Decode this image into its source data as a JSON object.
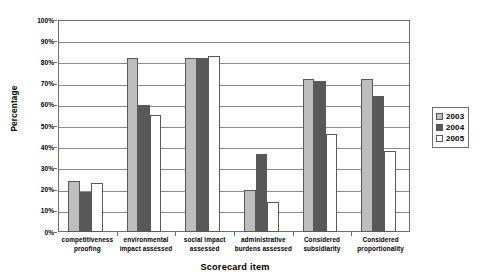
{
  "chart_data": {
    "type": "bar",
    "title": "",
    "xlabel": "Scorecard item",
    "ylabel": "Percentage",
    "ylim": [
      0,
      100
    ],
    "y_tick_labels": [
      "100%",
      "90%",
      "80%",
      "70%",
      "60%",
      "50%",
      "40%",
      "30%",
      "20%",
      "10%",
      "0%"
    ],
    "y_tick_values": [
      100,
      90,
      80,
      70,
      60,
      50,
      40,
      30,
      20,
      10,
      0
    ],
    "grid": true,
    "legend_position": "right",
    "categories": [
      "competitiveness proofing",
      "environmental impact assessed",
      "social impact assessed",
      "administrative burdens assessed",
      "Considered subsidiarity",
      "Considered proportionality"
    ],
    "category_lines": [
      [
        "competitiveness",
        "proofing"
      ],
      [
        "environmental",
        "impact assessed"
      ],
      [
        "social impact",
        "assessed"
      ],
      [
        "administrative",
        "burdens assessed"
      ],
      [
        "Considered",
        "subsidiarity"
      ],
      [
        "Considered",
        "proportionality"
      ]
    ],
    "series": [
      {
        "name": "2003",
        "color": "#bdbdbd",
        "values": [
          24,
          82,
          82,
          20,
          72,
          72
        ]
      },
      {
        "name": "2004",
        "color": "#585858",
        "values": [
          19,
          60,
          82,
          37,
          71,
          64
        ]
      },
      {
        "name": "2005",
        "color": "#ffffff",
        "values": [
          23,
          55,
          83,
          14,
          46,
          38
        ]
      }
    ]
  },
  "legend": {
    "entries": [
      {
        "label": "2003",
        "swatch": "legend-swatch-2003"
      },
      {
        "label": "2004",
        "swatch": "legend-swatch-2004"
      },
      {
        "label": "2005",
        "swatch": "legend-swatch-2005"
      }
    ]
  },
  "axes": {
    "y_title": "Percentage",
    "x_title": "Scorecard item"
  }
}
